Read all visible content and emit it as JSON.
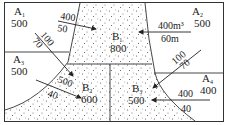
{
  "regions": {
    "A1": {
      "name": "A",
      "sub": "1",
      "value": "500"
    },
    "A2": {
      "name": "A",
      "sub": "2",
      "value": "500"
    },
    "A3": {
      "name": "A",
      "sub": "3",
      "value": "500"
    },
    "A4": {
      "name": "A",
      "sub": "4",
      "value": "400"
    },
    "B1": {
      "name": "B",
      "sub": "1",
      "value": "800"
    },
    "B2": {
      "name": "B",
      "sub": "2",
      "value": "600"
    },
    "B3": {
      "name": "B",
      "sub": "3",
      "value": "500"
    }
  },
  "flows": [
    {
      "id": "A1-B1",
      "top": "400",
      "bottom": "50"
    },
    {
      "id": "A2-B1",
      "top": "400m³",
      "bottom": "60m"
    },
    {
      "id": "A1-B2",
      "top": "100",
      "bottom": "70"
    },
    {
      "id": "A2-B3",
      "top": "100",
      "bottom": "70"
    },
    {
      "id": "A3-B2",
      "top": "500",
      "bottom": "40"
    },
    {
      "id": "A4-B3",
      "top": "400",
      "bottom": "40"
    }
  ],
  "colors": {
    "line": "#333333",
    "dots": "#555555",
    "background": "#ffffff"
  }
}
